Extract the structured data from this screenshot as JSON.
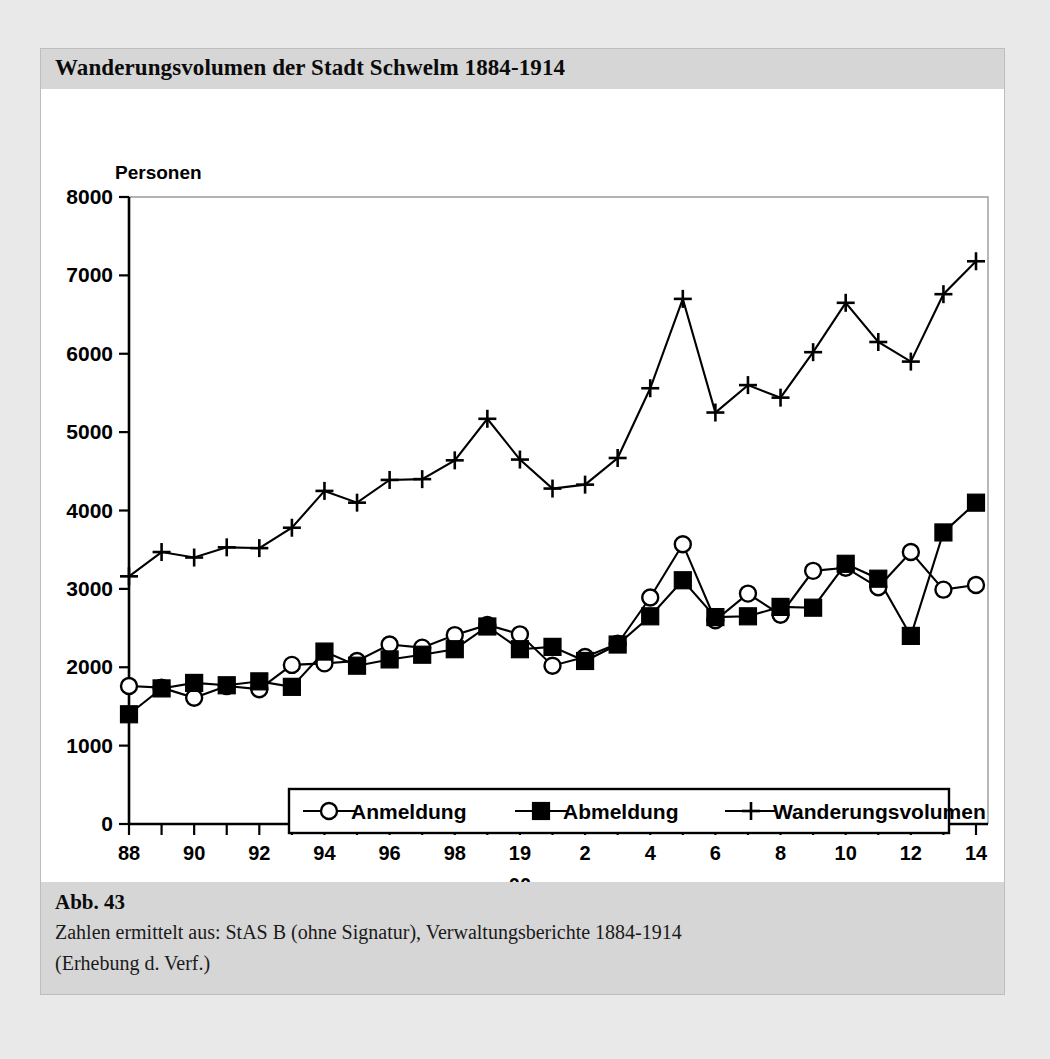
{
  "figure": {
    "title": "Wanderungsvolumen der Stadt Schwelm 1884-1914",
    "caption_title": "Abb. 43",
    "caption_line1": "Zahlen ermittelt aus: StAS B (ohne Signatur), Verwaltungsberichte 1884-1914",
    "caption_line2": "(Erhebung d. Verf.)"
  },
  "chart_data": {
    "type": "line",
    "title": "Wanderungsvolumen der Stadt Schwelm 1884-1914",
    "xlabel": "Jahr",
    "ylabel": "Personen",
    "ylim": [
      0,
      8000
    ],
    "ytick_values": [
      0,
      1000,
      2000,
      3000,
      4000,
      5000,
      6000,
      7000,
      8000
    ],
    "ytick_labels": [
      "0",
      "1000",
      "2000",
      "3000",
      "4000",
      "5000",
      "6000",
      "7000",
      "8000"
    ],
    "grid": false,
    "legend_position": "inside-bottom-center",
    "x": [
      1888,
      1889,
      1890,
      1891,
      1892,
      1893,
      1894,
      1895,
      1896,
      1897,
      1898,
      1899,
      1900,
      1901,
      1902,
      1903,
      1904,
      1905,
      1906,
      1907,
      1908,
      1909,
      1910,
      1911,
      1912,
      1913,
      1914
    ],
    "xtick_labels": [
      "88",
      "",
      "90",
      "",
      "92",
      "",
      "94",
      "",
      "96",
      "",
      "98",
      "",
      "19",
      "",
      "2",
      "",
      "4",
      "",
      "6",
      "",
      "8",
      "",
      "10",
      "",
      "12",
      "",
      "14"
    ],
    "xtick_sublabel": {
      "at": 1900,
      "text": "00"
    },
    "series": [
      {
        "name": "Anmeldung",
        "marker": "open-circle",
        "values": [
          1760,
          1740,
          1610,
          1760,
          1720,
          2030,
          2050,
          2080,
          2290,
          2250,
          2410,
          2540,
          2420,
          2020,
          2130,
          2300,
          2890,
          3570,
          2600,
          2940,
          2670,
          3230,
          3270,
          3020,
          3470,
          2990,
          3050
        ]
      },
      {
        "name": "Abmeldung",
        "marker": "filled-square",
        "values": [
          1400,
          1730,
          1800,
          1770,
          1820,
          1750,
          2200,
          2020,
          2100,
          2160,
          2230,
          2520,
          2230,
          2260,
          2080,
          2290,
          2650,
          3110,
          2640,
          2650,
          2770,
          2760,
          3320,
          3130,
          2400,
          3720,
          4100
        ]
      },
      {
        "name": "Wanderungsvolumen",
        "marker": "plus",
        "values": [
          3160,
          3470,
          3400,
          3530,
          3520,
          3780,
          4250,
          4100,
          4390,
          4400,
          4640,
          5170,
          4650,
          4280,
          4330,
          4670,
          5560,
          6700,
          5250,
          5600,
          5440,
          6020,
          6650,
          6150,
          5900,
          6760,
          7180
        ]
      }
    ]
  },
  "legend": {
    "items": [
      {
        "label": "Anmeldung",
        "marker": "open-circle"
      },
      {
        "label": "Abmeldung",
        "marker": "filled-square"
      },
      {
        "label": "Wanderungsvolumen",
        "marker": "plus"
      }
    ]
  }
}
